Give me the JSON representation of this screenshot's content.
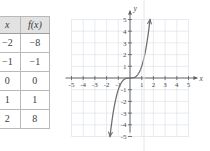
{
  "figure": {
    "name": "cubic-function-table-and-graph",
    "colors": {
      "grid": "#d7dde6",
      "axis": "#5a5a5a",
      "curve": "#6d6d6d",
      "table_header_bg": "#e2e2e2",
      "table_border": "#b9b9b9",
      "text": "#3c3c3c"
    }
  },
  "table": {
    "headers": [
      "x",
      "f(x)"
    ],
    "rows": [
      {
        "x": "−2",
        "fx": "−8"
      },
      {
        "x": "−1",
        "fx": "−1"
      },
      {
        "x": "0",
        "fx": "0"
      },
      {
        "x": "1",
        "fx": "1"
      },
      {
        "x": "2",
        "fx": "8"
      }
    ]
  },
  "chart_data": {
    "type": "line",
    "title": "",
    "xlabel": "x",
    "ylabel": "y",
    "xlim": [
      -5,
      5
    ],
    "ylim": [
      -5,
      5
    ],
    "grid": true,
    "legend": "none",
    "x_ticks": [
      "-5",
      "-4",
      "-3",
      "-2",
      "-1",
      "1",
      "2",
      "3",
      "4",
      "5"
    ],
    "y_ticks": [
      "5",
      "4",
      "3",
      "2",
      "1",
      "-1",
      "-2",
      "-3",
      "-4",
      "-5"
    ],
    "series": [
      {
        "name": "f(x) = x³",
        "equation": "y = x^3",
        "arrows": [
          "start",
          "end"
        ],
        "points": [
          {
            "x": -2,
            "y": -8
          },
          {
            "x": -1.71,
            "y": -5
          },
          {
            "x": -1.5,
            "y": -3.375
          },
          {
            "x": -1,
            "y": -1
          },
          {
            "x": -0.5,
            "y": -0.125
          },
          {
            "x": 0,
            "y": 0
          },
          {
            "x": 0.5,
            "y": 0.125
          },
          {
            "x": 1,
            "y": 1
          },
          {
            "x": 1.5,
            "y": 3.375
          },
          {
            "x": 1.71,
            "y": 5
          },
          {
            "x": 2,
            "y": 8
          }
        ]
      }
    ]
  }
}
